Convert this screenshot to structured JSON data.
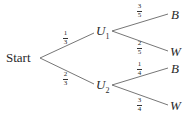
{
  "tree": {
    "root": {
      "label": "Start"
    },
    "level1": [
      {
        "node": "U",
        "sub": "1",
        "prob": {
          "num": "1",
          "den": "3"
        }
      },
      {
        "node": "U",
        "sub": "2",
        "prob": {
          "num": "2",
          "den": "3"
        }
      }
    ],
    "level2": [
      {
        "parent": "U1",
        "outcome": "B",
        "prob": {
          "num": "3",
          "den": "5"
        }
      },
      {
        "parent": "U1",
        "outcome": "W",
        "prob": {
          "num": "2",
          "den": "5"
        }
      },
      {
        "parent": "U2",
        "outcome": "B",
        "prob": {
          "num": "1",
          "den": "4"
        }
      },
      {
        "parent": "U2",
        "outcome": "W",
        "prob": {
          "num": "3",
          "den": "4"
        }
      }
    ]
  },
  "colors": {
    "line": "#555555",
    "text": "#2a2a2a",
    "background": "#ffffff"
  }
}
